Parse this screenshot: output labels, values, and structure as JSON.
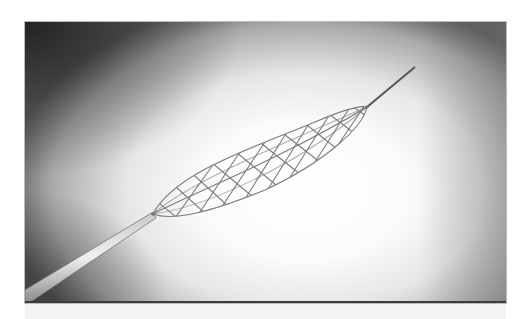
{
  "image": {
    "subject": "stent retriever on catheter wire",
    "style": "grayscale photograph",
    "colors": {
      "background_center": "#ffffff",
      "background_edge": "#5a5a5a",
      "corner_dark": "#1e1e1e",
      "mesh": "#6e6e6e",
      "wire": "#555555",
      "catheter": "#9a9a9a"
    }
  }
}
